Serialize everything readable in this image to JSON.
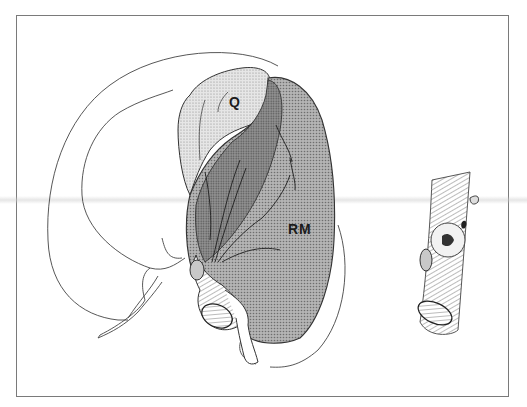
{
  "figure": {
    "type": "anatomical-illustration",
    "labels": {
      "q": "Q",
      "rm": "RM"
    },
    "colors": {
      "line": "#2a2a2a",
      "outline_light": "#555555",
      "fill_light_stipple": "#d9d9d9",
      "fill_medium": "#a9a9a9",
      "fill_dark": "#8c8c8c",
      "frame": "#7a7a7a",
      "background": "#ffffff"
    }
  }
}
